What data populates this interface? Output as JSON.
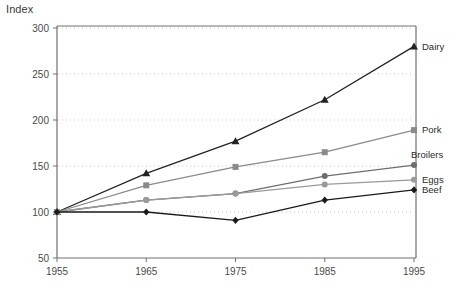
{
  "chart_data": {
    "type": "line",
    "title": "",
    "ylabel": "Index",
    "xlabel": "",
    "ylim": [
      50,
      300
    ],
    "xlim": [
      1955,
      1995
    ],
    "grid": true,
    "grid_style": "dotted-horizontal",
    "legend_position": "right-inline-end-of-line",
    "x": [
      1955,
      1965,
      1975,
      1985,
      1995
    ],
    "categories": [
      "1955",
      "1965",
      "1975",
      "1985",
      "1995"
    ],
    "yticks": [
      50,
      100,
      150,
      200,
      250,
      300
    ],
    "ytick_labels": [
      "50",
      "100",
      "150",
      "200",
      "250",
      "300"
    ],
    "xtick_labels": [
      "1955",
      "1965",
      "1975",
      "1985",
      "1995"
    ],
    "series": [
      {
        "name": "Dairy",
        "label": "Dairy",
        "marker": "triangle",
        "color": "#222222",
        "values": [
          100,
          142,
          177,
          222,
          280
        ]
      },
      {
        "name": "Pork",
        "label": "Pork",
        "marker": "square",
        "color": "#8a8a8a",
        "values": [
          100,
          129,
          149,
          165,
          189
        ]
      },
      {
        "name": "Broilers",
        "label": "Broilers",
        "marker": "circle",
        "color": "#6e6e6e",
        "values": [
          100,
          113,
          120,
          139,
          151
        ]
      },
      {
        "name": "Eggs",
        "label": "Eggs",
        "marker": "circle",
        "color": "#9a9a9a",
        "values": [
          100,
          113,
          120,
          130,
          135
        ]
      },
      {
        "name": "Beef",
        "label": "Beef",
        "marker": "diamond",
        "color": "#1a1a1a",
        "values": [
          100,
          100,
          91,
          113,
          124
        ]
      }
    ]
  },
  "colors": {
    "axis": "#707070",
    "grid": "#c9c9c9",
    "text": "#3a3a3a",
    "background": "#ffffff"
  }
}
